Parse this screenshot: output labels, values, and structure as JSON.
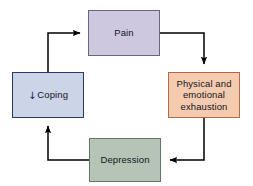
{
  "diagram": {
    "type": "cycle-flowchart",
    "orientation": "clockwise",
    "background_color": "#ffffff",
    "nodes": [
      {
        "id": "pain",
        "label": "Pain",
        "position": "top",
        "fill_color": "#cdc7e0",
        "border_color": "#6b6382",
        "text_color": "#14141e"
      },
      {
        "id": "exhaustion",
        "label": "Physical and\nemotional\nexhaustion",
        "position": "right",
        "fill_color": "#f5cbb0",
        "border_color": "#b06a46",
        "text_color": "#14141e"
      },
      {
        "id": "depression",
        "label": "Depression",
        "position": "bottom",
        "fill_color": "#b6c4b6",
        "border_color": "#5f7a63",
        "text_color": "#14141e"
      },
      {
        "id": "coping",
        "label": "Coping",
        "prefix_symbol": "↓",
        "position": "left",
        "fill_color": "#ccd5e8",
        "border_color": "#2b3a63",
        "text_color": "#14141e"
      }
    ],
    "edges": [
      {
        "id": "pain-to-exhaustion",
        "from": "Pain",
        "to": "Physical and emotional exhaustion",
        "style": "elbow-arrow",
        "color": "#000000"
      },
      {
        "id": "exhaustion-to-depression",
        "from": "Physical and emotional exhaustion",
        "to": "Depression",
        "style": "elbow-arrow",
        "color": "#000000"
      },
      {
        "id": "depression-to-coping",
        "from": "Depression",
        "to": "Coping",
        "style": "elbow-arrow",
        "color": "#000000"
      },
      {
        "id": "coping-to-pain",
        "from": "Coping",
        "to": "Pain",
        "style": "elbow-arrow",
        "color": "#000000"
      }
    ]
  }
}
